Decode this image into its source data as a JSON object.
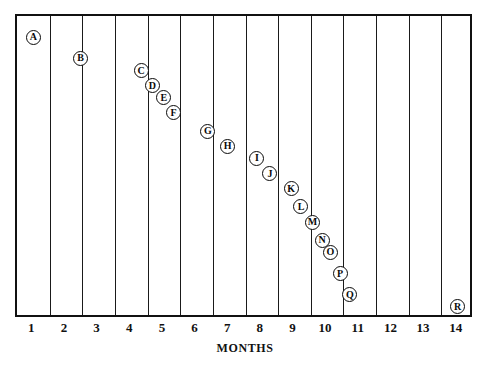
{
  "chart_data": {
    "type": "scatter",
    "title": "",
    "xlabel": "MONTHS",
    "ylabel": "",
    "xlim": [
      0.5,
      14.5
    ],
    "ylim": [
      0,
      1
    ],
    "grid": "vertical-only",
    "legend": "none",
    "xticks": [
      "1",
      "2",
      "3",
      "4",
      "5",
      "6",
      "7",
      "8",
      "9",
      "10",
      "11",
      "12",
      "13",
      "14"
    ],
    "yticks": [],
    "point_label_style": "circled-letter",
    "points": [
      {
        "label": "A",
        "x": 1.0,
        "y": 0.93
      },
      {
        "label": "B",
        "x": 2.45,
        "y": 0.86
      },
      {
        "label": "C",
        "x": 4.3,
        "y": 0.82
      },
      {
        "label": "D",
        "x": 4.65,
        "y": 0.77
      },
      {
        "label": "E",
        "x": 5.0,
        "y": 0.73
      },
      {
        "label": "F",
        "x": 5.3,
        "y": 0.68
      },
      {
        "label": "G",
        "x": 6.35,
        "y": 0.62
      },
      {
        "label": "H",
        "x": 6.95,
        "y": 0.57
      },
      {
        "label": "I",
        "x": 7.85,
        "y": 0.53
      },
      {
        "label": "J",
        "x": 8.25,
        "y": 0.48
      },
      {
        "label": "K",
        "x": 8.9,
        "y": 0.43
      },
      {
        "label": "L",
        "x": 9.2,
        "y": 0.37
      },
      {
        "label": "M",
        "x": 9.55,
        "y": 0.32
      },
      {
        "label": "N",
        "x": 9.85,
        "y": 0.26
      },
      {
        "label": "O",
        "x": 10.1,
        "y": 0.22
      },
      {
        "label": "P",
        "x": 10.4,
        "y": 0.15
      },
      {
        "label": "Q",
        "x": 10.7,
        "y": 0.08
      },
      {
        "label": "R",
        "x": 14.0,
        "y": 0.04
      }
    ]
  },
  "style": {
    "frame_color": "#111111",
    "gridline_color": "#1a1a1a",
    "marker_fill": "#ffffff",
    "marker_stroke": "#0a0a0a",
    "background": "#ffffff"
  }
}
